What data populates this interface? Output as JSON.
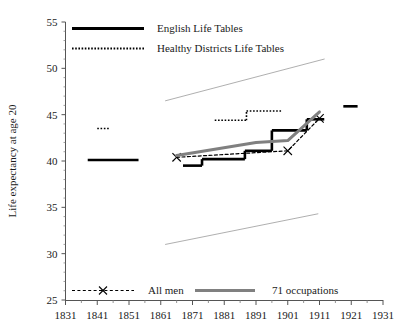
{
  "chart_data": {
    "type": "line",
    "title": "",
    "xlabel": "",
    "ylabel": "Life expectancy at age 20",
    "xlim": [
      1831,
      1931
    ],
    "ylim": [
      25,
      55
    ],
    "xticks": [
      1831,
      1841,
      1851,
      1861,
      1871,
      1881,
      1891,
      1901,
      1911,
      1921,
      1931
    ],
    "yticks": [
      25,
      30,
      35,
      40,
      45,
      50,
      55
    ],
    "xtick_labels": [
      "1831",
      "1841",
      "1851",
      "1861",
      "1871",
      "1881",
      "1891",
      "1901",
      "1911",
      "1921",
      "1931"
    ],
    "ytick_labels": [
      "25",
      "30",
      "35",
      "40",
      "45",
      "50",
      "55"
    ],
    "xminor_interval": 5,
    "grid": false,
    "legend_position": "top-left and bottom-inside",
    "series": [
      {
        "name": "English Life Tables",
        "style": "solid-step",
        "color": "#000000",
        "width": 2.6,
        "points": [
          {
            "x": 1833.5,
            "y": 40.1
          },
          {
            "x": 1838.0,
            "y": 40.1
          },
          {
            "x": 1838.0,
            "y": 40.1
          },
          {
            "x": 1854.0,
            "y": 40.1
          }
        ],
        "segments": [
          [
            [
              1838.0,
              40.1
            ],
            [
              1854.0,
              40.1
            ]
          ],
          [
            [
              1868.0,
              39.5
            ],
            [
              1874.0,
              39.5
            ]
          ],
          [
            [
              1874.0,
              39.5
            ],
            [
              1874.0,
              40.2
            ]
          ],
          [
            [
              1874.0,
              40.2
            ],
            [
              1887.5,
              40.2
            ]
          ],
          [
            [
              1887.5,
              40.2
            ],
            [
              1887.5,
              41.1
            ]
          ],
          [
            [
              1887.5,
              41.1
            ],
            [
              1896.0,
              41.1
            ]
          ],
          [
            [
              1896.0,
              41.1
            ],
            [
              1896.0,
              43.3
            ]
          ],
          [
            [
              1896.0,
              43.3
            ],
            [
              1907.0,
              43.3
            ]
          ],
          [
            [
              1907.0,
              43.3
            ],
            [
              1907.0,
              44.5
            ]
          ],
          [
            [
              1907.0,
              44.5
            ],
            [
              1912.5,
              44.5
            ]
          ],
          [
            [
              1918.5,
              45.9
            ],
            [
              1923.0,
              45.9
            ]
          ]
        ]
      },
      {
        "name": "Healthy Districts Life Tables",
        "style": "dotted-step",
        "color": "#000000",
        "width": 1.6,
        "segments": [
          [
            [
              1841.0,
              43.5
            ],
            [
              1845.0,
              43.5
            ]
          ],
          [
            [
              1878.0,
              44.4
            ],
            [
              1888.0,
              44.4
            ]
          ],
          [
            [
              1888.0,
              44.4
            ],
            [
              1888.0,
              45.4
            ]
          ],
          [
            [
              1888.0,
              45.4
            ],
            [
              1899.0,
              45.4
            ]
          ]
        ]
      },
      {
        "name": "All men",
        "style": "dashed-marker-x",
        "color": "#000000",
        "width": 1.2,
        "points": [
          {
            "x": 1866.0,
            "y": 40.4
          },
          {
            "x": 1901.0,
            "y": 41.1
          },
          {
            "x": 1911.0,
            "y": 44.6
          }
        ]
      },
      {
        "name": "71 occupations",
        "style": "solid-thick-gray",
        "color": "#808080",
        "width": 3.0,
        "points": [
          {
            "x": 1866.0,
            "y": 40.6
          },
          {
            "x": 1891.0,
            "y": 42.0
          },
          {
            "x": 1901.0,
            "y": 42.2
          },
          {
            "x": 1911.0,
            "y": 45.3
          }
        ]
      },
      {
        "name": "upper-reference-trend",
        "style": "thin-solid",
        "color": "#9a9a9a",
        "width": 0.8,
        "points": [
          {
            "x": 1862.5,
            "y": 46.5
          },
          {
            "x": 1912.5,
            "y": 51.0
          }
        ]
      },
      {
        "name": "lower-reference-trend",
        "style": "thin-solid",
        "color": "#9a9a9a",
        "width": 0.8,
        "points": [
          {
            "x": 1862.5,
            "y": 31.0
          },
          {
            "x": 1910.5,
            "y": 34.3
          }
        ]
      }
    ]
  },
  "legend_top": {
    "items": [
      {
        "label": "English Life Tables",
        "swatch": "solid-black"
      },
      {
        "label": "Healthy Districts Life Tables",
        "swatch": "dotted-black"
      }
    ]
  },
  "legend_bottom": {
    "items": [
      {
        "label": "All men",
        "swatch": "dashed-x-black"
      },
      {
        "label": "71 occupations",
        "swatch": "thick-gray"
      }
    ]
  },
  "axes": {
    "y_axis_title": "Life expectancy at age 20"
  },
  "colors": {
    "ink": "#1a1a1a",
    "series_black": "#000000",
    "series_gray": "#808080",
    "reference_gray": "#9a9a9a",
    "background": "#ffffff"
  }
}
